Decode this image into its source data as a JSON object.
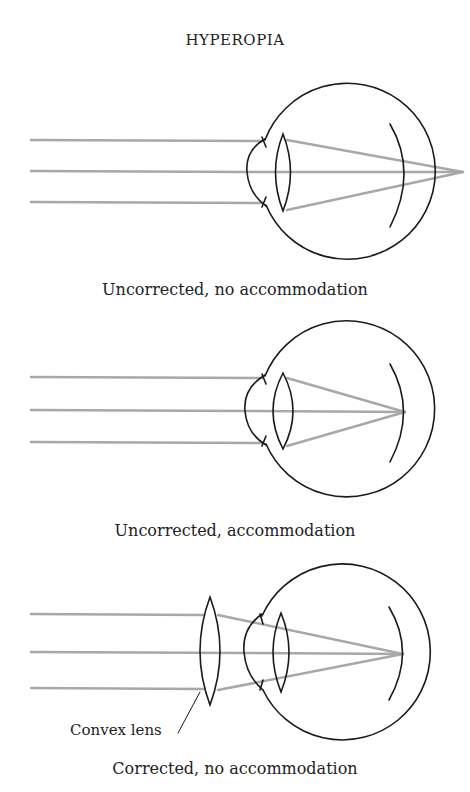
{
  "title": "HYPEROPIA",
  "panels": [
    {
      "caption": "Uncorrected, no accommodation",
      "condition": "uncorrected",
      "accommodation": false,
      "focus": "behind retina"
    },
    {
      "caption": "Uncorrected, accommodation",
      "condition": "uncorrected",
      "accommodation": true,
      "focus": "on retina"
    },
    {
      "caption": "Corrected, no accommodation",
      "condition": "corrected",
      "accommodation": false,
      "focus": "on retina",
      "label": "Convex lens"
    }
  ],
  "colors": {
    "outline": "#1a1a1a",
    "ray": "#a8a8a8",
    "text": "#222222"
  }
}
